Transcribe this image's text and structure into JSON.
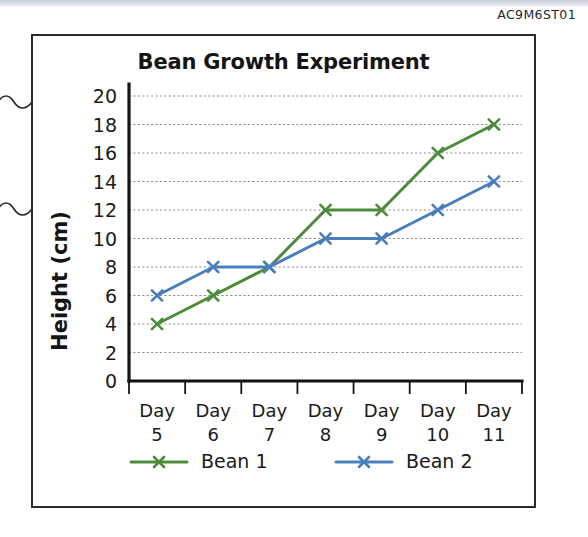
{
  "document": {
    "code": "AC9M6ST01"
  },
  "figure": {
    "title": "Bean Growth Experiment"
  },
  "chart_data": {
    "type": "line",
    "title": "Bean Growth Experiment",
    "xlabel": "",
    "ylabel": "Height (cm)",
    "categories": [
      "Day 5",
      "Day 6",
      "Day 7",
      "Day 8",
      "Day 9",
      "Day 10",
      "Day 11"
    ],
    "category_lines": [
      [
        "Day",
        "5"
      ],
      [
        "Day",
        "6"
      ],
      [
        "Day",
        "7"
      ],
      [
        "Day",
        "8"
      ],
      [
        "Day",
        "9"
      ],
      [
        "Day",
        "10"
      ],
      [
        "Day",
        "11"
      ]
    ],
    "yticks": [
      0,
      2,
      4,
      6,
      8,
      10,
      12,
      14,
      16,
      18,
      20
    ],
    "ylim": [
      0,
      20
    ],
    "grid": true,
    "grid_axis": "y",
    "legend_position": "bottom",
    "marker": "x",
    "series": [
      {
        "name": "Bean 1",
        "color": "#4c8b3c",
        "values": [
          4,
          6,
          8,
          12,
          12,
          16,
          18
        ]
      },
      {
        "name": "Bean 2",
        "color": "#4a7ebb",
        "values": [
          6,
          8,
          8,
          10,
          10,
          12,
          14
        ]
      }
    ]
  }
}
